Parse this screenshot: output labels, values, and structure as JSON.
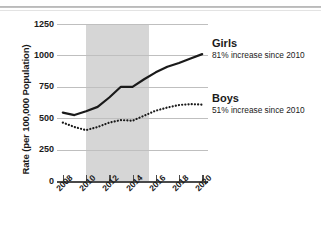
{
  "chart_data": {
    "type": "line",
    "title": "",
    "subtitle": "",
    "xlabel": "",
    "ylabel": "Rate (per 100,000 Population)",
    "x": [
      2008,
      2009,
      2010,
      2011,
      2012,
      2013,
      2014,
      2015,
      2016,
      2017,
      2018,
      2019,
      2020
    ],
    "xlim": [
      2007.5,
      2020.5
    ],
    "ylim": [
      0,
      1250
    ],
    "yticks": [
      0,
      250,
      500,
      750,
      1000,
      1250
    ],
    "ytick_labels": [
      "0",
      "250",
      "500",
      "750",
      "1000",
      "1250"
    ],
    "xticks": [
      2008,
      2010,
      2012,
      2014,
      2016,
      2018,
      2020
    ],
    "xtick_labels": [
      "2008",
      "2010",
      "2012",
      "2014",
      "2016",
      "2018",
      "2020"
    ],
    "grid": "horizontal",
    "legend_position": "right-inline-annotations",
    "shaded_region": {
      "label": "",
      "x_start": 2010,
      "x_end": 2015.4,
      "color": "#d6d6d6"
    },
    "series": [
      {
        "name": "Girls",
        "style": "solid",
        "color": "#1a1a1a",
        "annotation": "81% increase since 2010",
        "values": [
          545,
          525,
          555,
          590,
          665,
          750,
          750,
          810,
          865,
          910,
          940,
          975,
          1010
        ]
      },
      {
        "name": "Boys",
        "style": "dotted",
        "color": "#1a1a1a",
        "annotation": "51% increase since 2010",
        "values": [
          465,
          430,
          405,
          430,
          465,
          485,
          480,
          520,
          560,
          585,
          605,
          612,
          608
        ]
      }
    ]
  },
  "axes": {
    "y_title": "Rate (per 100,000 Population)"
  },
  "notes": {
    "girls": {
      "name": "Girls",
      "detail": "81% increase since 2010"
    },
    "boys": {
      "name": "Boys",
      "detail": "51% increase since 2010"
    }
  }
}
